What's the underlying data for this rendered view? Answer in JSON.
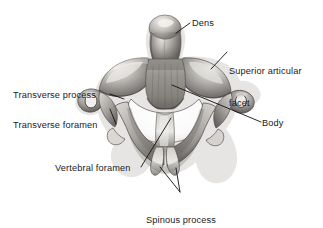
{
  "figure": {
    "background_color": "#ffffff",
    "text_color": "#1a1a1a",
    "leader_line_color": "#111111",
    "width": 323,
    "height": 228
  },
  "labels": {
    "dens": "Dens",
    "superior_articular_facet_line1": "Superior articular",
    "superior_articular_facet_line2": "facet",
    "transverse_process": "Transverse process",
    "transverse_foramen": "Transverse foramen",
    "body": "Body",
    "vertebral_foramen": "Vertebral foramen",
    "spinous_process_line1": "Spinous process",
    "spinous_process_line2": "(bifid)"
  },
  "illustration": {
    "style": "grayscale airbrush anatomical rendering",
    "subject": "cervical vertebra",
    "tones": {
      "bone_light": "#e8e6e3",
      "bone_mid": "#a9a6a2",
      "bone_dark": "#6d6a67",
      "bone_shadow": "#3c3a38",
      "foramen_white": "#fdfdfd"
    },
    "parts": [
      "dens",
      "superior articular facet (left)",
      "superior articular facet (right)",
      "body",
      "transverse process (left)",
      "transverse process (right)",
      "transverse foramen (left)",
      "transverse foramen (right)",
      "vertebral foramen",
      "lamina (left)",
      "lamina (right)",
      "spinous process prong (left)",
      "spinous process prong (right)"
    ]
  }
}
